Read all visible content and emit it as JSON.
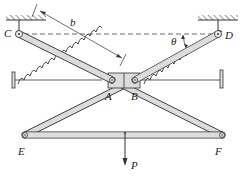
{
  "diagram": {
    "type": "mechanism",
    "labels": {
      "C": "C",
      "D": "D",
      "A": "A",
      "B": "B",
      "E": "E",
      "F": "F",
      "b": "b",
      "theta": "θ",
      "P": "P"
    },
    "colors": {
      "link_fill": "#dcdcdc",
      "stroke": "#333333",
      "background": "#ffffff"
    }
  }
}
